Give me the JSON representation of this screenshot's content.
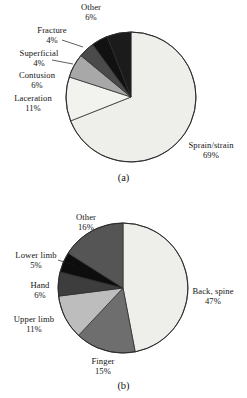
{
  "figure": {
    "panels": [
      {
        "caption": "(a)",
        "chart": {
          "type": "pie",
          "title": "",
          "slices": [
            {
              "label": "Sprain/strain",
              "value": 69,
              "pct_text": "69%",
              "color": "#eeeeea"
            },
            {
              "label": "Laceration",
              "value": 11,
              "pct_text": "11%",
              "color": "#f2f2ee"
            },
            {
              "label": "Contusion",
              "value": 6,
              "pct_text": "6%",
              "color": "#a8a8a8"
            },
            {
              "label": "Superficial",
              "value": 4,
              "pct_text": "4%",
              "color": "#4a4a4a"
            },
            {
              "label": "Fracture",
              "value": 4,
              "pct_text": "4%",
              "color": "#111111"
            },
            {
              "label": "Other",
              "value": 6,
              "pct_text": "6%",
              "color": "#1b1b1b"
            }
          ]
        }
      },
      {
        "caption": "(b)",
        "chart": {
          "type": "pie",
          "title": "",
          "slices": [
            {
              "label": "Back, spine",
              "value": 47,
              "pct_text": "47%",
              "color": "#eeeeea"
            },
            {
              "label": "Finger",
              "value": 15,
              "pct_text": "15%",
              "color": "#6e6e6e"
            },
            {
              "label": "Upper limb",
              "value": 11,
              "pct_text": "11%",
              "color": "#bdbdbd"
            },
            {
              "label": "Hand",
              "value": 6,
              "pct_text": "6%",
              "color": "#3d3d3d"
            },
            {
              "label": "Lower limb",
              "value": 5,
              "pct_text": "5%",
              "color": "#0d0d0d"
            },
            {
              "label": "Other",
              "value": 16,
              "pct_text": "16%",
              "color": "#555555"
            }
          ]
        }
      }
    ]
  },
  "chart_data": [
    {
      "type": "pie",
      "panel": "(a)",
      "title": "Injury type distribution",
      "categories": [
        "Sprain/strain",
        "Laceration",
        "Contusion",
        "Superficial",
        "Fracture",
        "Other"
      ],
      "values": [
        69,
        11,
        6,
        4,
        4,
        6
      ],
      "unit": "percent",
      "labels": [
        "Sprain/strain 69%",
        "Laceration 11%",
        "Contusion 6%",
        "Superficial 4%",
        "Fracture 4%",
        "Other 6%"
      ],
      "colors": [
        "#eeeeea",
        "#f2f2ee",
        "#a8a8a8",
        "#4a4a4a",
        "#111111",
        "#1b1b1b"
      ],
      "legend": "none",
      "grid": false,
      "start_angle_deg": 0,
      "direction": "clockwise"
    },
    {
      "type": "pie",
      "panel": "(b)",
      "title": "Injury body-part distribution",
      "categories": [
        "Back, spine",
        "Finger",
        "Upper limb",
        "Hand",
        "Lower limb",
        "Other"
      ],
      "values": [
        47,
        15,
        11,
        6,
        5,
        16
      ],
      "unit": "percent",
      "labels": [
        "Back, spine 47%",
        "Finger 15%",
        "Upper limb 11%",
        "Hand 6%",
        "Lower limb 5%",
        "Other 16%"
      ],
      "colors": [
        "#eeeeea",
        "#6e6e6e",
        "#bdbdbd",
        "#3d3d3d",
        "#0d0d0d",
        "#555555"
      ],
      "legend": "none",
      "grid": false,
      "start_angle_deg": 0,
      "direction": "clockwise"
    }
  ]
}
